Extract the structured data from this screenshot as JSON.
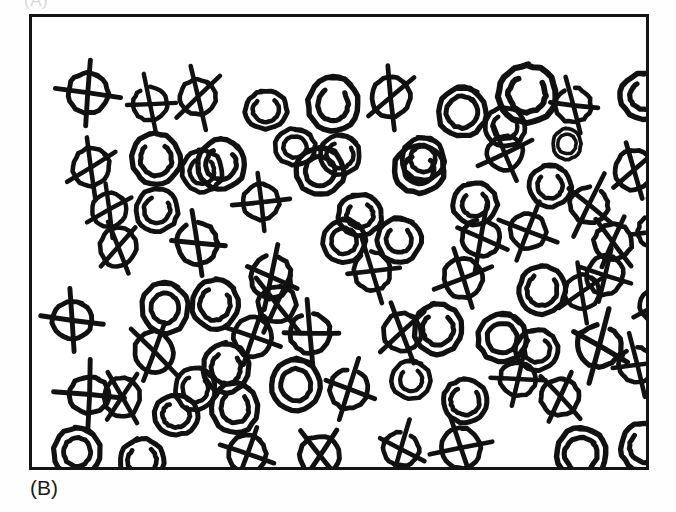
{
  "figure": {
    "panel_label": "(B)",
    "top_clipped_label": "(A)",
    "ink_color": "#111111",
    "background_color": "#ffffff",
    "border_color": "#141414",
    "symbol_legend": {
      "spiral": "hand-drawn spiral / double circle (target)",
      "crossed": "hand-drawn circle crossed out with a line (distractor)"
    },
    "counts": {
      "spiral": 38,
      "crossed": 41,
      "total": 79
    },
    "frame": {
      "x": 29,
      "y": 14,
      "width": 620,
      "height": 456
    }
  },
  "chart_data": {
    "type": "scatter",
    "title": "(B)",
    "xlabel": "",
    "ylabel": "",
    "xlim": [
      0,
      620
    ],
    "ylim": [
      0,
      456
    ],
    "grid": false,
    "legend": "none",
    "series": [
      {
        "name": "spiral",
        "marker": "spiral",
        "count": 38
      },
      {
        "name": "crossed",
        "marker": "crossed-circle",
        "count": 41
      }
    ],
    "points": [
      {
        "x": 36,
        "y": 56,
        "t": "crossed",
        "r": 20,
        "rot": 2,
        "v": 1
      },
      {
        "x": 101,
        "y": 70,
        "t": "crossed",
        "r": 17,
        "rot": -18,
        "v": 2
      },
      {
        "x": 148,
        "y": 62,
        "t": "crossed",
        "r": 18,
        "rot": 14,
        "v": 3
      },
      {
        "x": 213,
        "y": 72,
        "t": "spiral",
        "r": 21,
        "rot": -6,
        "v": 2
      },
      {
        "x": 276,
        "y": 62,
        "t": "spiral",
        "r": 25,
        "rot": 4,
        "v": 1
      },
      {
        "x": 340,
        "y": 61,
        "t": "crossed",
        "r": 19,
        "rot": 20,
        "v": 3
      },
      {
        "x": 406,
        "y": 71,
        "t": "spiral",
        "r": 24,
        "rot": -4,
        "v": 3
      },
      {
        "x": 466,
        "y": 48,
        "t": "spiral",
        "r": 29,
        "rot": 8,
        "v": 2
      },
      {
        "x": 523,
        "y": 70,
        "t": "crossed",
        "r": 18,
        "rot": -12,
        "v": 2
      },
      {
        "x": 588,
        "y": 54,
        "t": "spiral",
        "r": 25,
        "rot": 5,
        "v": 1
      },
      {
        "x": 41,
        "y": 132,
        "t": "crossed",
        "r": 18,
        "rot": 28,
        "v": 3
      },
      {
        "x": 100,
        "y": 118,
        "t": "spiral",
        "r": 24,
        "rot": -8,
        "v": 2
      },
      {
        "x": 165,
        "y": 123,
        "t": "spiral",
        "r": 24,
        "rot": 6,
        "v": 1
      },
      {
        "x": 264,
        "y": 130,
        "t": "spiral",
        "r": 24,
        "rot": -3,
        "v": 3
      },
      {
        "x": 362,
        "y": 127,
        "t": "spiral",
        "r": 25,
        "rot": 7,
        "v": 2
      },
      {
        "x": 455,
        "y": 118,
        "t": "crossed",
        "r": 18,
        "rot": -20,
        "v": 1
      },
      {
        "x": 521,
        "y": 113,
        "t": "spiral",
        "r": 14,
        "rot": 0,
        "v": 4
      },
      {
        "x": 583,
        "y": 134,
        "t": "crossed",
        "r": 19,
        "rot": 16,
        "v": 3
      },
      {
        "x": 104,
        "y": 172,
        "t": "spiral",
        "r": 21,
        "rot": 12,
        "v": 2
      },
      {
        "x": 211,
        "y": 167,
        "t": "crossed",
        "r": 18,
        "rot": -6,
        "v": 1
      },
      {
        "x": 421,
        "y": 165,
        "t": "spiral",
        "r": 22,
        "rot": -9,
        "v": 1
      },
      {
        "x": 538,
        "y": 169,
        "t": "crossed",
        "r": 19,
        "rot": 22,
        "v": 2
      },
      {
        "x": 68,
        "y": 212,
        "t": "crossed",
        "r": 18,
        "rot": 8,
        "v": 3
      },
      {
        "x": 145,
        "y": 206,
        "t": "crossed",
        "r": 20,
        "rot": -14,
        "v": 2
      },
      {
        "x": 291,
        "y": 203,
        "t": "spiral",
        "r": 21,
        "rot": 3,
        "v": 3
      },
      {
        "x": 345,
        "y": 201,
        "t": "spiral",
        "r": 22,
        "rot": -5,
        "v": 1
      },
      {
        "x": 478,
        "y": 196,
        "t": "crossed",
        "r": 18,
        "rot": 18,
        "v": 1
      },
      {
        "x": 562,
        "y": 206,
        "t": "crossed",
        "r": 19,
        "rot": -10,
        "v": 3
      },
      {
        "x": 219,
        "y": 240,
        "t": "crossed",
        "r": 20,
        "rot": 4,
        "v": 2
      },
      {
        "x": 412,
        "y": 242,
        "t": "crossed",
        "r": 19,
        "rot": -22,
        "v": 1
      },
      {
        "x": 487,
        "y": 250,
        "t": "spiral",
        "r": 23,
        "rot": 6,
        "v": 2
      },
      {
        "x": 533,
        "y": 258,
        "t": "crossed",
        "r": 17,
        "rot": 16,
        "v": 3
      },
      {
        "x": 608,
        "y": 270,
        "t": "crossed",
        "r": 18,
        "rot": -25,
        "v": 1
      },
      {
        "x": 20,
        "y": 283,
        "t": "crossed",
        "r": 20,
        "rot": 2,
        "v": 1
      },
      {
        "x": 110,
        "y": 268,
        "t": "spiral",
        "r": 23,
        "rot": -7,
        "v": 3
      },
      {
        "x": 160,
        "y": 264,
        "t": "spiral",
        "r": 23,
        "rot": 10,
        "v": 1
      },
      {
        "x": 382,
        "y": 288,
        "t": "spiral",
        "r": 24,
        "rot": -4,
        "v": 2
      },
      {
        "x": 446,
        "y": 297,
        "t": "spiral",
        "r": 24,
        "rot": 8,
        "v": 3
      },
      {
        "x": 484,
        "y": 312,
        "t": "spiral",
        "r": 21,
        "rot": -6,
        "v": 1
      },
      {
        "x": 545,
        "y": 307,
        "t": "crossed",
        "r": 22,
        "rot": 14,
        "v": 2
      },
      {
        "x": 103,
        "y": 316,
        "t": "crossed",
        "r": 19,
        "rot": -12,
        "v": 3
      },
      {
        "x": 171,
        "y": 328,
        "t": "spiral",
        "r": 23,
        "rot": 5,
        "v": 2
      },
      {
        "x": 202,
        "y": 301,
        "t": "crossed",
        "r": 19,
        "rot": 20,
        "v": 1
      },
      {
        "x": 258,
        "y": 296,
        "t": "crossed",
        "r": 20,
        "rot": -8,
        "v": 2
      },
      {
        "x": 351,
        "y": 296,
        "t": "crossed",
        "r": 19,
        "rot": 10,
        "v": 3
      },
      {
        "x": 587,
        "y": 330,
        "t": "crossed",
        "r": 18,
        "rot": -18,
        "v": 2
      },
      {
        "x": 37,
        "y": 358,
        "t": "crossed",
        "r": 20,
        "rot": 1,
        "v": 1
      },
      {
        "x": 240,
        "y": 344,
        "t": "spiral",
        "r": 24,
        "rot": -5,
        "v": 3
      },
      {
        "x": 298,
        "y": 353,
        "t": "crossed",
        "r": 19,
        "rot": 12,
        "v": 2
      },
      {
        "x": 360,
        "y": 344,
        "t": "spiral",
        "r": 19,
        "rot": -9,
        "v": 1
      },
      {
        "x": 411,
        "y": 362,
        "t": "spiral",
        "r": 22,
        "rot": 6,
        "v": 2
      },
      {
        "x": 509,
        "y": 361,
        "t": "crossed",
        "r": 19,
        "rot": -16,
        "v": 3
      },
      {
        "x": 122,
        "y": 376,
        "t": "spiral",
        "r": 22,
        "rot": 8,
        "v": 2
      },
      {
        "x": 180,
        "y": 368,
        "t": "spiral",
        "r": 23,
        "rot": -3,
        "v": 1
      },
      {
        "x": 22,
        "y": 412,
        "t": "spiral",
        "r": 23,
        "rot": 4,
        "v": 3
      },
      {
        "x": 88,
        "y": 422,
        "t": "spiral",
        "r": 22,
        "rot": -7,
        "v": 2
      },
      {
        "x": 196,
        "y": 418,
        "t": "crossed",
        "r": 19,
        "rot": 14,
        "v": 1
      },
      {
        "x": 268,
        "y": 418,
        "t": "crossed",
        "r": 20,
        "rot": -2,
        "v": 3
      },
      {
        "x": 351,
        "y": 414,
        "t": "crossed",
        "r": 18,
        "rot": 18,
        "v": 2
      },
      {
        "x": 410,
        "y": 412,
        "t": "crossed",
        "r": 19,
        "rot": -14,
        "v": 1
      },
      {
        "x": 524,
        "y": 412,
        "t": "spiral",
        "r": 25,
        "rot": 5,
        "v": 3
      },
      {
        "x": 589,
        "y": 406,
        "t": "spiral",
        "r": 24,
        "rot": -6,
        "v": 2
      },
      {
        "x": 453,
        "y": 90,
        "t": "spiral",
        "r": 20,
        "rot": 3,
        "v": 2
      },
      {
        "x": 306,
        "y": 176,
        "t": "spiral",
        "r": 22,
        "rot": -11,
        "v": 1
      },
      {
        "x": 243,
        "y": 110,
        "t": "spiral",
        "r": 20,
        "rot": 9,
        "v": 3
      },
      {
        "x": 322,
        "y": 236,
        "t": "crossed",
        "r": 18,
        "rot": -19,
        "v": 2
      },
      {
        "x": 143,
        "y": 352,
        "t": "spiral",
        "r": 20,
        "rot": 7,
        "v": 1
      },
      {
        "x": 60,
        "y": 176,
        "t": "crossed",
        "r": 17,
        "rot": 24,
        "v": 3
      },
      {
        "x": 497,
        "y": 148,
        "t": "spiral",
        "r": 21,
        "rot": -8,
        "v": 1
      },
      {
        "x": 430,
        "y": 202,
        "t": "crossed",
        "r": 19,
        "rot": 6,
        "v": 2
      },
      {
        "x": 226,
        "y": 268,
        "t": "crossed",
        "r": 19,
        "rot": -9,
        "v": 3
      },
      {
        "x": 555,
        "y": 240,
        "t": "crossed",
        "r": 18,
        "rot": 12,
        "v": 1
      },
      {
        "x": 150,
        "y": 134,
        "t": "spiral",
        "r": 20,
        "rot": 0,
        "v": 2
      },
      {
        "x": 370,
        "y": 121,
        "t": "spiral",
        "r": 21,
        "rot": -5,
        "v": 3
      },
      {
        "x": 288,
        "y": 118,
        "t": "spiral",
        "r": 20,
        "rot": 11,
        "v": 1
      },
      {
        "x": 606,
        "y": 196,
        "t": "crossed",
        "r": 18,
        "rot": -21,
        "v": 2
      },
      {
        "x": 468,
        "y": 344,
        "t": "crossed",
        "r": 18,
        "rot": 9,
        "v": 1
      },
      {
        "x": 72,
        "y": 362,
        "t": "crossed",
        "r": 18,
        "rot": -4,
        "v": 3
      }
    ]
  }
}
